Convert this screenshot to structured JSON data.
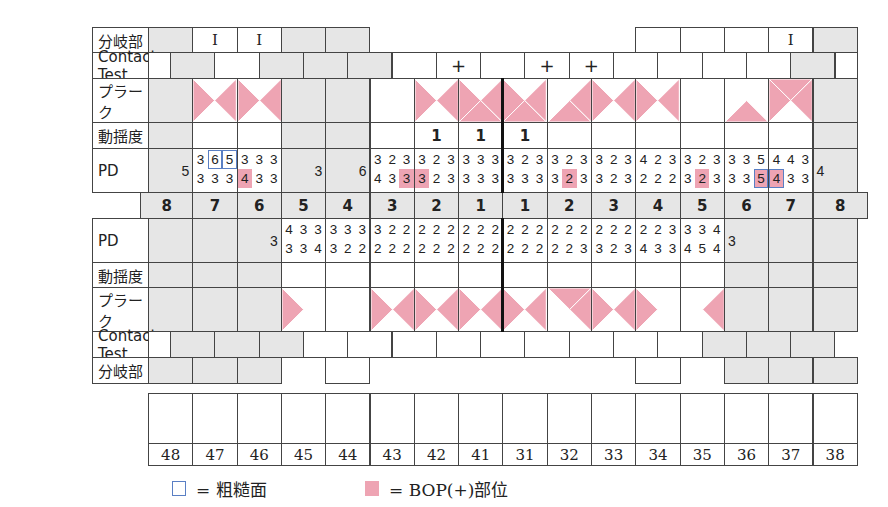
{
  "labels": {
    "furcation": "分岐部",
    "contact_test": "Contact Test",
    "plaque": "プラーク",
    "mobility": "動揺度",
    "pd": "PD"
  },
  "colors": {
    "bop": "#eea4b3",
    "rough": "#5a7fc4",
    "missing": "#e6e6e6"
  },
  "upper": {
    "teeth": [
      "8",
      "7",
      "6",
      "5",
      "4",
      "3",
      "2",
      "1",
      "1",
      "2",
      "3",
      "4",
      "5",
      "6",
      "7",
      "8"
    ],
    "furcation": [
      {
        "state": "grey",
        "text": ""
      },
      {
        "state": "white",
        "text": "I"
      },
      {
        "state": "white",
        "text": "I"
      },
      {
        "state": "grey",
        "text": ""
      },
      {
        "state": "grey",
        "text": ""
      },
      {
        "state": "none",
        "text": ""
      },
      {
        "state": "none",
        "text": ""
      },
      {
        "state": "none",
        "text": ""
      },
      {
        "state": "none",
        "text": ""
      },
      {
        "state": "none",
        "text": ""
      },
      {
        "state": "none",
        "text": ""
      },
      {
        "state": "white",
        "text": ""
      },
      {
        "state": "white",
        "text": ""
      },
      {
        "state": "white",
        "text": ""
      },
      {
        "state": "white",
        "text": "I"
      },
      {
        "state": "grey",
        "text": ""
      }
    ],
    "contact": [
      {
        "state": "grey",
        "text": ""
      },
      {
        "state": "white",
        "text": ""
      },
      {
        "state": "grey",
        "text": ""
      },
      {
        "state": "grey",
        "text": ""
      },
      {
        "state": "grey",
        "text": ""
      },
      {
        "state": "white",
        "text": ""
      },
      {
        "state": "white",
        "text": "+"
      },
      {
        "state": "white",
        "text": ""
      },
      {
        "state": "white",
        "text": "+"
      },
      {
        "state": "white",
        "text": "+"
      },
      {
        "state": "white",
        "text": ""
      },
      {
        "state": "white",
        "text": ""
      },
      {
        "state": "white",
        "text": ""
      },
      {
        "state": "white",
        "text": ""
      },
      {
        "state": "grey",
        "text": ""
      }
    ],
    "plaque": [
      {
        "grey": true,
        "faces": []
      },
      {
        "grey": false,
        "faces": [
          "left",
          "right"
        ]
      },
      {
        "grey": false,
        "faces": [
          "left",
          "right"
        ]
      },
      {
        "grey": true,
        "faces": []
      },
      {
        "grey": true,
        "faces": []
      },
      {
        "grey": false,
        "faces": []
      },
      {
        "grey": false,
        "faces": [
          "left",
          "right"
        ]
      },
      {
        "grey": false,
        "faces": [
          "left",
          "right",
          "bottom"
        ]
      },
      {
        "grey": false,
        "faces": [
          "left",
          "right",
          "bottom"
        ]
      },
      {
        "grey": false,
        "faces": [
          "right",
          "bottom"
        ]
      },
      {
        "grey": false,
        "faces": [
          "left",
          "right"
        ]
      },
      {
        "grey": false,
        "faces": [
          "left",
          "right"
        ]
      },
      {
        "grey": false,
        "faces": []
      },
      {
        "grey": false,
        "faces": [
          "bottom"
        ]
      },
      {
        "grey": false,
        "faces": [
          "top",
          "left",
          "right"
        ]
      },
      {
        "grey": true,
        "faces": []
      }
    ],
    "mobility": [
      "",
      "",
      "",
      "",
      "",
      "",
      "1",
      "1",
      "1",
      "",
      "",
      "",
      "",
      "",
      "",
      ""
    ],
    "pd": [
      {
        "single": "5"
      },
      {
        "top": [
          "3",
          "6",
          "5"
        ],
        "bottom": [
          "3",
          "3",
          "3"
        ],
        "rough_top": [
          1,
          2
        ],
        "bop_bottom": []
      },
      {
        "top": [
          "3",
          "3",
          "3"
        ],
        "bottom": [
          "4",
          "3",
          "3"
        ],
        "bop_bottom": [
          0
        ]
      },
      {
        "single": "3"
      },
      {
        "single": "6"
      },
      {
        "top": [
          "3",
          "2",
          "3"
        ],
        "bottom": [
          "4",
          "3",
          "3"
        ],
        "bop_bottom": [
          2
        ]
      },
      {
        "top": [
          "3",
          "2",
          "3"
        ],
        "bottom": [
          "3",
          "2",
          "3"
        ],
        "bop_bottom": [
          0
        ]
      },
      {
        "top": [
          "3",
          "3",
          "3"
        ],
        "bottom": [
          "3",
          "3",
          "3"
        ],
        "bop_bottom": []
      },
      {
        "top": [
          "3",
          "2",
          "3"
        ],
        "bottom": [
          "3",
          "3",
          "3"
        ],
        "bop_bottom": []
      },
      {
        "top": [
          "3",
          "2",
          "3"
        ],
        "bottom": [
          "3",
          "2",
          "3"
        ],
        "bop_bottom": [
          1
        ]
      },
      {
        "top": [
          "3",
          "2",
          "3"
        ],
        "bottom": [
          "3",
          "2",
          "3"
        ],
        "bop_bottom": []
      },
      {
        "top": [
          "4",
          "2",
          "3"
        ],
        "bottom": [
          "2",
          "2",
          "2"
        ],
        "bop_bottom": []
      },
      {
        "top": [
          "3",
          "2",
          "3"
        ],
        "bottom": [
          "3",
          "2",
          "3"
        ],
        "bop_bottom": [
          1
        ]
      },
      {
        "top": [
          "3",
          "3",
          "5"
        ],
        "bottom": [
          "3",
          "3",
          "5"
        ],
        "bop_bottom": [
          2
        ],
        "rough_bottom": [
          2
        ]
      },
      {
        "top": [
          "4",
          "4",
          "3"
        ],
        "bottom": [
          "4",
          "3",
          "3"
        ],
        "bop_bottom": [
          0
        ],
        "rough_bottom": [
          0
        ]
      },
      {
        "single": "4"
      }
    ]
  },
  "lower": {
    "pd": [
      {
        "grey": true
      },
      {
        "grey": true
      },
      {
        "single": "3"
      },
      {
        "top": [
          "4",
          "3",
          "3"
        ],
        "bottom": [
          "3",
          "3",
          "4"
        ]
      },
      {
        "top": [
          "3",
          "3",
          "3"
        ],
        "bottom": [
          "3",
          "2",
          "2"
        ]
      },
      {
        "top": [
          "3",
          "2",
          "2"
        ],
        "bottom": [
          "2",
          "2",
          "2"
        ]
      },
      {
        "top": [
          "2",
          "2",
          "2"
        ],
        "bottom": [
          "2",
          "2",
          "2"
        ]
      },
      {
        "top": [
          "2",
          "2",
          "2"
        ],
        "bottom": [
          "2",
          "2",
          "2"
        ]
      },
      {
        "top": [
          "2",
          "2",
          "2"
        ],
        "bottom": [
          "2",
          "2",
          "2"
        ]
      },
      {
        "top": [
          "2",
          "2",
          "2"
        ],
        "bottom": [
          "2",
          "2",
          "3"
        ]
      },
      {
        "top": [
          "2",
          "2",
          "2"
        ],
        "bottom": [
          "3",
          "2",
          "3"
        ]
      },
      {
        "top": [
          "2",
          "2",
          "3"
        ],
        "bottom": [
          "4",
          "3",
          "3"
        ]
      },
      {
        "top": [
          "3",
          "3",
          "4"
        ],
        "bottom": [
          "4",
          "5",
          "4"
        ]
      },
      {
        "single": "3"
      },
      {
        "grey": true
      },
      {
        "grey": true
      }
    ],
    "mobility": [
      "",
      "",
      "",
      "",
      "",
      "",
      "",
      "",
      "",
      "",
      "",
      "",
      "",
      "",
      "",
      ""
    ],
    "plaque": [
      {
        "grey": true,
        "faces": []
      },
      {
        "grey": true,
        "faces": []
      },
      {
        "grey": true,
        "faces": []
      },
      {
        "grey": false,
        "faces": [
          "left"
        ]
      },
      {
        "grey": false,
        "faces": []
      },
      {
        "grey": false,
        "faces": [
          "left",
          "right"
        ]
      },
      {
        "grey": false,
        "faces": [
          "left",
          "right"
        ]
      },
      {
        "grey": false,
        "faces": [
          "left",
          "right"
        ]
      },
      {
        "grey": false,
        "faces": [
          "left",
          "right"
        ]
      },
      {
        "grey": false,
        "faces": [
          "top",
          "right"
        ]
      },
      {
        "grey": false,
        "faces": [
          "left",
          "right"
        ]
      },
      {
        "grey": false,
        "faces": [
          "left"
        ]
      },
      {
        "grey": false,
        "faces": [
          "right"
        ]
      },
      {
        "grey": true,
        "faces": []
      },
      {
        "grey": true,
        "faces": []
      },
      {
        "grey": true,
        "faces": []
      }
    ],
    "contact": [
      {
        "state": "grey",
        "text": ""
      },
      {
        "state": "grey",
        "text": ""
      },
      {
        "state": "grey",
        "text": ""
      },
      {
        "state": "white",
        "text": ""
      },
      {
        "state": "white",
        "text": ""
      },
      {
        "state": "white",
        "text": ""
      },
      {
        "state": "white",
        "text": ""
      },
      {
        "state": "white",
        "text": ""
      },
      {
        "state": "white",
        "text": ""
      },
      {
        "state": "white",
        "text": ""
      },
      {
        "state": "white",
        "text": ""
      },
      {
        "state": "white",
        "text": ""
      },
      {
        "state": "grey",
        "text": ""
      },
      {
        "state": "grey",
        "text": ""
      },
      {
        "state": "grey",
        "text": ""
      }
    ],
    "furcation": [
      {
        "state": "grey",
        "text": ""
      },
      {
        "state": "grey",
        "text": ""
      },
      {
        "state": "grey",
        "text": ""
      },
      {
        "state": "none",
        "text": ""
      },
      {
        "state": "white",
        "text": ""
      },
      {
        "state": "none",
        "text": ""
      },
      {
        "state": "none",
        "text": ""
      },
      {
        "state": "none",
        "text": ""
      },
      {
        "state": "none",
        "text": ""
      },
      {
        "state": "none",
        "text": ""
      },
      {
        "state": "none",
        "text": ""
      },
      {
        "state": "white",
        "text": ""
      },
      {
        "state": "none",
        "text": ""
      },
      {
        "state": "grey",
        "text": ""
      },
      {
        "state": "grey",
        "text": ""
      },
      {
        "state": "grey",
        "text": ""
      }
    ]
  },
  "fdi_numbers": [
    "48",
    "47",
    "46",
    "45",
    "44",
    "43",
    "42",
    "41",
    "31",
    "32",
    "33",
    "34",
    "35",
    "36",
    "37",
    "38"
  ],
  "legend": {
    "rough_text": "= 粗糙面",
    "bop_text": "= BOP(+)部位"
  }
}
